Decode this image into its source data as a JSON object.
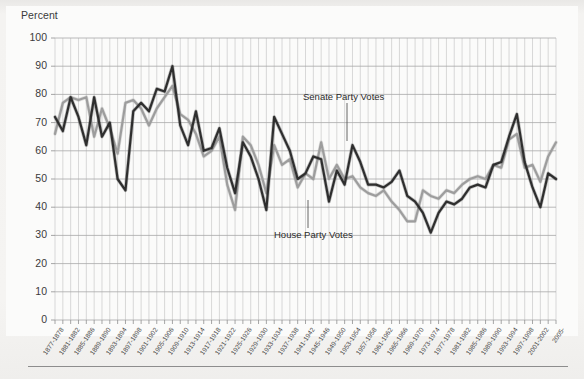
{
  "figure": {
    "background_color": "#f2f1ef",
    "plot_background_color": "#fbfbfa",
    "bottom_rule": "horizontal-rule"
  },
  "axis": {
    "y_axis_title": "Percent",
    "y_ticks": [
      "0",
      "10",
      "20",
      "30",
      "40",
      "50",
      "60",
      "70",
      "80",
      "90",
      "100"
    ]
  },
  "annotations": {
    "senate": "Senate Party Votes",
    "house": "House Party Votes"
  },
  "chart_data": {
    "type": "line",
    "title": "",
    "subtitle": "",
    "xlabel": "",
    "ylabel": "Percent",
    "ylim": [
      0,
      100
    ],
    "ytick_step": 10,
    "grid": true,
    "legend_position": "inline-annotations",
    "categories": [
      "1877-1878",
      "1879-1880",
      "1881-1882",
      "1883-1884",
      "1885-1886",
      "1887-1888",
      "1889-1890",
      "1891-1892",
      "1893-1894",
      "1895-1896",
      "1897-1898",
      "1899-1900",
      "1901-1902",
      "1903-1904",
      "1905-1906",
      "1907-1908",
      "1909-1910",
      "1911-1912",
      "1913-1914",
      "1915-1916",
      "1917-1918",
      "1919-1920",
      "1921-1922",
      "1923-1924",
      "1925-1926",
      "1927-1928",
      "1929-1930",
      "1931-1932",
      "1933-1934",
      "1935-1936",
      "1937-1938",
      "1939-1940",
      "1941-1942",
      "1943-1944",
      "1945-1946",
      "1947-1948",
      "1949-1950",
      "1951-1952",
      "1953-1954",
      "1955-1956",
      "1957-1958",
      "1959-1960",
      "1961-1962",
      "1963-1964",
      "1965-1966",
      "1967-1968",
      "1969-1970",
      "1971-1972",
      "1973-1974",
      "1975-1976",
      "1977-1978",
      "1979-1980",
      "1981-1982",
      "1983-1984",
      "1985-1986",
      "1987-1988",
      "1989-1990",
      "1991-1992",
      "1993-1994",
      "1995-1996",
      "1997-1998",
      "1999-2000",
      "2001-2002",
      "2003-2004",
      "2005-"
    ],
    "xtick_labels": [
      "1877-1878",
      "1881-1882",
      "1885-1886",
      "1889-1890",
      "1893-1894",
      "1897-1898",
      "1901-1902",
      "1905-1906",
      "1909-1910",
      "1913-1914",
      "1917-1918",
      "1921-1922",
      "1925-1926",
      "1929-1930",
      "1933-1934",
      "1937-1938",
      "1941-1942",
      "1945-1946",
      "1949-1950",
      "1953-1954",
      "1957-1958",
      "1961-1962",
      "1965-1966",
      "1969-1970",
      "1973-1974",
      "1977-1978",
      "1981-1982",
      "1985-1986",
      "1989-1990",
      "1993-1994",
      "1997-1998",
      "2001-2002",
      "2005-"
    ],
    "series": [
      {
        "name": "House Party Votes",
        "color": "#2e2e2e",
        "values": [
          72,
          67,
          79,
          72,
          62,
          79,
          65,
          70,
          50,
          46,
          74,
          77,
          74,
          82,
          81,
          90,
          69,
          62,
          74,
          60,
          61,
          68,
          54,
          45,
          63,
          58,
          50,
          39,
          72,
          66,
          60,
          50,
          52,
          58,
          57,
          42,
          53,
          48,
          62,
          56,
          48,
          48,
          47,
          49,
          53,
          44,
          42,
          38,
          31,
          38,
          42,
          41,
          43,
          47,
          48,
          47,
          55,
          56,
          65,
          73,
          56,
          47,
          40,
          52,
          50
        ]
      },
      {
        "name": "Senate Party Votes",
        "color": "#9d9d9d",
        "values": [
          66,
          77,
          79,
          78,
          79,
          65,
          75,
          68,
          59,
          77,
          78,
          75,
          69,
          75,
          79,
          83,
          73,
          71,
          66,
          58,
          60,
          65,
          48,
          39,
          65,
          62,
          55,
          45,
          62,
          55,
          57,
          47,
          52,
          50,
          63,
          50,
          55,
          50,
          51,
          47,
          45,
          44,
          46,
          42,
          39,
          35,
          35,
          46,
          44,
          43,
          46,
          45,
          48,
          50,
          51,
          50,
          55,
          54,
          64,
          66,
          54,
          55,
          49,
          58,
          63
        ]
      }
    ]
  }
}
